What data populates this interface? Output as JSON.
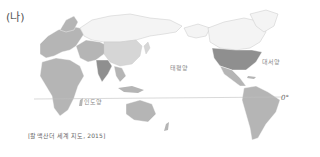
{
  "panel_label": "(나)",
  "map": {
    "projection": "Pacific-centered world map",
    "oceans": [
      {
        "name": "pacific",
        "label": "태평양"
      },
      {
        "name": "atlantic",
        "label": "대서양"
      },
      {
        "name": "indian",
        "label": "인도양"
      }
    ],
    "equator_label": "0°",
    "colors": {
      "land_dark": "#8f8f8f",
      "land_mid": "#b5b5b5",
      "land_light": "#d6d6d6",
      "land_white": "#f4f4f4",
      "border": "#c8c8c8",
      "equator_line": "#c0c0c0"
    }
  },
  "source": "[칼맥산더 세계 지도, 2015]"
}
